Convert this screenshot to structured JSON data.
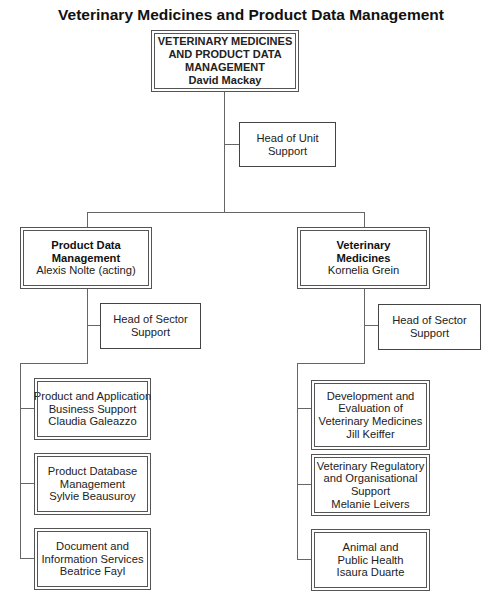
{
  "title": "Veterinary Medicines and Product Data Management",
  "head": {
    "lines": [
      "VETERINARY MEDICINES",
      "AND PRODUCT DATA",
      "MANAGEMENT",
      "David Mackay"
    ]
  },
  "unit_support": {
    "lines": [
      "Head of Unit",
      "Support"
    ]
  },
  "sectors": [
    {
      "name_lines": [
        "Product Data",
        "Management"
      ],
      "head": "Alexis Nolte (acting)",
      "support_lines": [
        "Head of Sector",
        "Support"
      ],
      "sections": [
        {
          "lines": [
            "Product and Application",
            "Business Support",
            "Claudia Galeazzo"
          ]
        },
        {
          "lines": [
            "Product Database",
            "Management",
            "Sylvie Beausuroy"
          ]
        },
        {
          "lines": [
            "Document and",
            "Information Services",
            "Beatrice Fayl"
          ]
        }
      ]
    },
    {
      "name_lines": [
        "Veterinary",
        "Medicines"
      ],
      "head": "Kornelia Grein",
      "support_lines": [
        "Head of Sector",
        "Support"
      ],
      "sections": [
        {
          "lines": [
            "Development and",
            "Evaluation of",
            "Veterinary Medicines",
            "Jill Keiffer"
          ]
        },
        {
          "lines": [
            "Veterinary Regulatory",
            "and Organisational",
            "Support",
            "Melanie Leivers"
          ]
        },
        {
          "lines": [
            "Animal and",
            "Public Health",
            "Isaura Duarte"
          ]
        }
      ]
    }
  ]
}
